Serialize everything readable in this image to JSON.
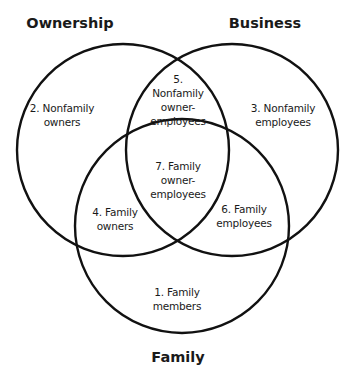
{
  "diagram": {
    "type": "venn",
    "sets": [
      {
        "id": "ownership",
        "label": "Ownership",
        "cx": 123,
        "cy": 150,
        "r": 106
      },
      {
        "id": "business",
        "label": "Business",
        "cx": 232,
        "cy": 150,
        "r": 106
      },
      {
        "id": "family",
        "label": "Family",
        "cx": 182,
        "cy": 226,
        "r": 107
      }
    ],
    "regions": [
      {
        "id": "r1",
        "lines": [
          "1. Family",
          "members"
        ],
        "sets": [
          "family"
        ]
      },
      {
        "id": "r2",
        "lines": [
          "2. Nonfamily",
          "owners"
        ],
        "sets": [
          "ownership"
        ]
      },
      {
        "id": "r3",
        "lines": [
          "3. Nonfamily",
          "employees"
        ],
        "sets": [
          "business"
        ]
      },
      {
        "id": "r4",
        "lines": [
          "4. Family",
          "owners"
        ],
        "sets": [
          "ownership",
          "family"
        ]
      },
      {
        "id": "r5",
        "lines": [
          "5.",
          "Nonfamily",
          "owner-",
          "employees"
        ],
        "sets": [
          "ownership",
          "business"
        ]
      },
      {
        "id": "r6",
        "lines": [
          "6. Family",
          "employees"
        ],
        "sets": [
          "business",
          "family"
        ]
      },
      {
        "id": "r7",
        "lines": [
          "7. Family",
          "owner-",
          "employees"
        ],
        "sets": [
          "ownership",
          "business",
          "family"
        ]
      }
    ],
    "colors": {
      "stroke": "#111111",
      "text": "#1a1a1a",
      "background": "#ffffff"
    }
  }
}
